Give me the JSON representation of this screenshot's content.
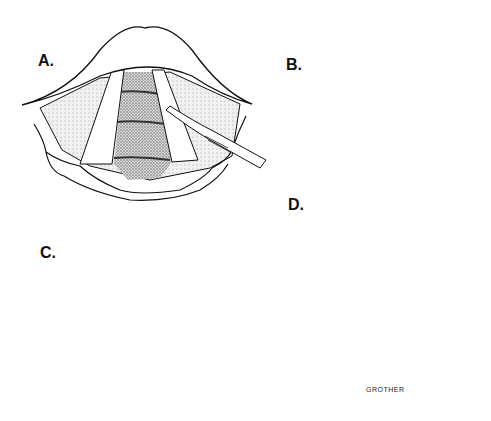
{
  "figure": {
    "type": "surgical illustration",
    "panels": [
      {
        "id": "A",
        "label": "A.",
        "description": "Laryngeal view with vocal folds; scalpel incising right vocal fold"
      },
      {
        "id": "B",
        "label": "B.",
        "description": "Close-up of incision with flap elevation, arrows indicating dissection directions"
      },
      {
        "id": "C",
        "label": "C.",
        "description": "Forceps removing lesion from beneath the mucosal flap"
      },
      {
        "id": "D",
        "label": "D.",
        "description": "Vocal folds after procedure with dashed line showing closed incision"
      }
    ],
    "signature": "GROTHER"
  },
  "colors": {
    "ink": "#111111",
    "stipple": "#6e6e6e",
    "background": "#ffffff"
  }
}
